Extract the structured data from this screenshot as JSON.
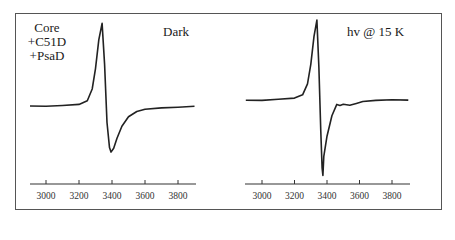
{
  "panels": [
    {
      "id": "left",
      "sample_label_lines": [
        "Core",
        "+C51D",
        "+PsaD"
      ],
      "condition_label": "Dark"
    },
    {
      "id": "right",
      "condition_label": "hv @ 15 K"
    }
  ],
  "chart_data": [
    {
      "type": "line",
      "title": "Dark",
      "annotation": "Core +C51D +PsaD",
      "xlabel": "",
      "ylabel": "",
      "xlim": [
        2900,
        3900
      ],
      "xticks": [
        3000,
        3200,
        3400,
        3600,
        3800
      ],
      "yaxis_shown": false,
      "grid": false,
      "series": [
        {
          "name": "Dark",
          "x": [
            2900,
            3000,
            3100,
            3200,
            3250,
            3280,
            3300,
            3320,
            3340,
            3355,
            3370,
            3385,
            3394,
            3410,
            3430,
            3460,
            3500,
            3550,
            3600,
            3700,
            3800,
            3900
          ],
          "y": [
            0.0,
            0.0,
            0.01,
            0.02,
            0.06,
            0.2,
            0.45,
            0.8,
            1.0,
            0.5,
            -0.2,
            -0.5,
            -0.55,
            -0.5,
            -0.38,
            -0.24,
            -0.13,
            -0.07,
            -0.04,
            -0.02,
            -0.01,
            0.0
          ]
        }
      ]
    },
    {
      "type": "line",
      "title": "hv @ 15 K",
      "xlabel": "",
      "ylabel": "",
      "xlim": [
        2900,
        3900
      ],
      "xticks": [
        3000,
        3200,
        3400,
        3600,
        3800
      ],
      "yaxis_shown": false,
      "grid": false,
      "series": [
        {
          "name": "hv @ 15 K",
          "x": [
            2900,
            3000,
            3100,
            3200,
            3250,
            3280,
            3300,
            3320,
            3338,
            3350,
            3362,
            3370,
            3375,
            3380,
            3400,
            3430,
            3460,
            3480,
            3500,
            3540,
            3580,
            3620,
            3700,
            3800,
            3900
          ],
          "y": [
            0.0,
            0.0,
            0.01,
            0.02,
            0.06,
            0.2,
            0.45,
            0.8,
            1.0,
            0.4,
            -0.4,
            -0.85,
            -0.94,
            -0.7,
            -0.45,
            -0.2,
            -0.06,
            -0.07,
            -0.05,
            -0.06,
            -0.04,
            -0.02,
            -0.01,
            0.0,
            0.0
          ]
        }
      ]
    }
  ]
}
